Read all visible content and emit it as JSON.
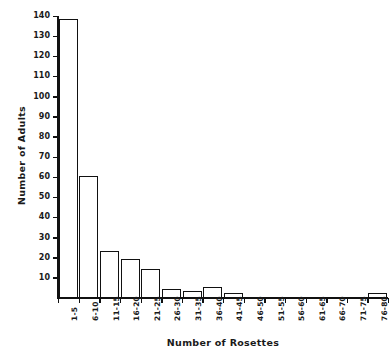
{
  "header": {
    "faint_text": ""
  },
  "chart_data": {
    "type": "bar",
    "title": "",
    "xlabel": "Number of Rosettes",
    "ylabel": "Number of Adults",
    "categories": [
      "1-5",
      "6-10",
      "11-15",
      "16-20",
      "21-25",
      "26-30",
      "31-35",
      "36-40",
      "41-45",
      "46-50",
      "51-55",
      "56-60",
      "61-65",
      "66-70",
      "71-75",
      "76-80"
    ],
    "values": [
      138,
      60,
      23,
      19,
      14,
      4,
      3,
      5,
      2,
      0,
      0,
      0,
      0,
      0,
      0,
      2
    ],
    "ylim": [
      0,
      140
    ],
    "yticks": [
      10,
      20,
      30,
      40,
      50,
      60,
      70,
      80,
      90,
      100,
      110,
      120,
      130,
      140
    ],
    "ytick_labels": [
      "10",
      "20",
      "30",
      "40",
      "50",
      "60",
      "70",
      "80",
      "90",
      "100",
      "110",
      "120",
      "130",
      "140"
    ],
    "grid": false,
    "legend": null,
    "colors": {
      "bar_fill": "#ffffff",
      "bar_edge": "#111111",
      "axis": "#111111",
      "text": "#1a1a1a",
      "background": "#ffffff"
    }
  }
}
